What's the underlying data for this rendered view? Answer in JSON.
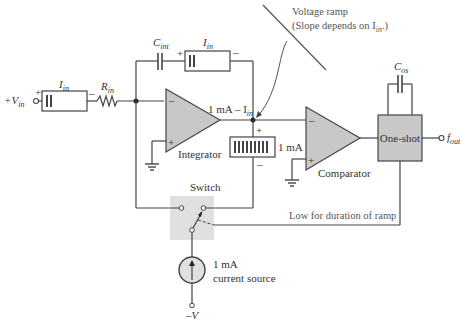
{
  "diagram": {
    "labels": {
      "vin": "+V",
      "vin_sub": "in",
      "iin_left": "I",
      "iin_left_sub": "in",
      "rin": "R",
      "rin_sub": "in",
      "cint": "C",
      "cint_sub": "int",
      "iin_top": "I",
      "iin_top_sub": "in",
      "integrator": "Integrator",
      "node_current": "1 mA – I",
      "node_current_sub": "in",
      "ma_bar": "1 mA",
      "comparator": "Comparator",
      "cos": "C",
      "cos_sub": "os",
      "oneshot": "One-shot",
      "fout": "f",
      "fout_sub": "out",
      "switch": "Switch",
      "low_note": "Low for duration of ramp",
      "source_line1": "1 mA",
      "source_line2": "current source",
      "neg_v": "–V",
      "ramp_line1": "Voltage ramp",
      "ramp_line2": "(Slope depends on I",
      "ramp_line2_sub": "in",
      "ramp_line2_end": ".)",
      "plus": "+",
      "minus": "–"
    },
    "colors": {
      "wire": "#444444",
      "fill_gray": "#c8c8c8",
      "switch_bg": "#e0e0e0",
      "text": "#333333",
      "note": "#555555"
    }
  }
}
